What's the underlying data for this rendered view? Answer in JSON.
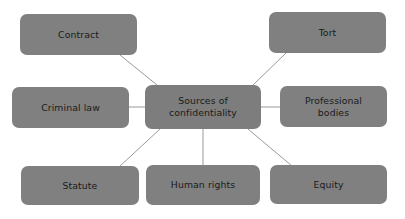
{
  "diagram": {
    "type": "concept-map",
    "title": "Sources of confidentiality",
    "background_color": "#ffffff",
    "node_fill_color": "#808080",
    "node_text_color": "#1a1a1a",
    "connector_color": "#9a9a9a",
    "center": {
      "label": "Sources of\nconfidentiality",
      "x": 145,
      "y": 85,
      "w": 116,
      "h": 44
    },
    "nodes": [
      {
        "id": "contract",
        "label": "Contract",
        "x": 20,
        "y": 14,
        "w": 117,
        "h": 41
      },
      {
        "id": "tort",
        "label": "Tort",
        "x": 269,
        "y": 12,
        "w": 117,
        "h": 41
      },
      {
        "id": "criminal-law",
        "label": "Criminal law",
        "x": 12,
        "y": 87,
        "w": 117,
        "h": 41
      },
      {
        "id": "professional-bodies",
        "label": "Professional\nbodies",
        "x": 280,
        "y": 86,
        "w": 107,
        "h": 41
      },
      {
        "id": "statute",
        "label": "Statute",
        "x": 21,
        "y": 166,
        "w": 118,
        "h": 39
      },
      {
        "id": "human-rights",
        "label": "Human rights",
        "x": 146,
        "y": 165,
        "w": 114,
        "h": 40
      },
      {
        "id": "equity",
        "label": "Equity",
        "x": 270,
        "y": 165,
        "w": 117,
        "h": 39
      }
    ],
    "connectors": [
      {
        "from": "center",
        "to": "contract",
        "x1": 157,
        "y1": 85,
        "x2": 120,
        "y2": 55
      },
      {
        "from": "center",
        "to": "tort",
        "x1": 252,
        "y1": 86,
        "x2": 286,
        "y2": 53
      },
      {
        "from": "center",
        "to": "criminal-law",
        "x1": 145,
        "y1": 107,
        "x2": 129,
        "y2": 107
      },
      {
        "from": "center",
        "to": "professional-bodies",
        "x1": 261,
        "y1": 107,
        "x2": 280,
        "y2": 107
      },
      {
        "from": "center",
        "to": "statute",
        "x1": 160,
        "y1": 129,
        "x2": 119,
        "y2": 167
      },
      {
        "from": "center",
        "to": "human-rights",
        "x1": 203,
        "y1": 129,
        "x2": 203,
        "y2": 166
      },
      {
        "from": "center",
        "to": "equity",
        "x1": 248,
        "y1": 129,
        "x2": 292,
        "y2": 166
      }
    ]
  }
}
